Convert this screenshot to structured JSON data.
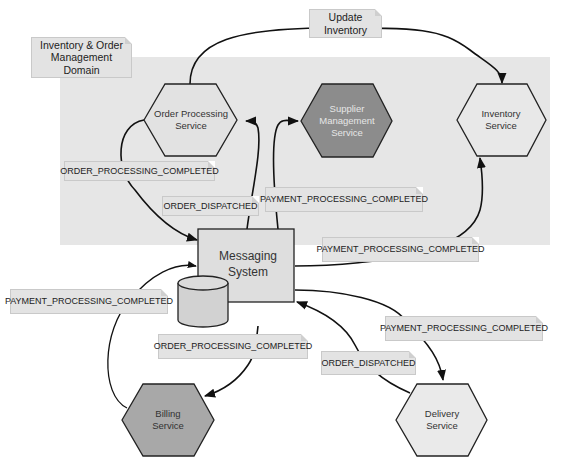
{
  "domain_label": "Inventory & Order Management Domain",
  "colors": {
    "domain_bg": "#e6e6e6",
    "note_bg": "#e3e3e3",
    "hex_light": "#e8e8e8",
    "hex_dark": "#8a8a8a",
    "hex_medium": "#a8a8a8",
    "stroke": "#222222"
  },
  "nodes": {
    "order_processing": {
      "label": "Order Processing Service"
    },
    "supplier_management": {
      "label": "Supplier Management Service"
    },
    "inventory": {
      "label": "Inventory Service"
    },
    "messaging": {
      "label": "Messaging System"
    },
    "billing": {
      "label": "Billing Service"
    },
    "delivery": {
      "label": "Delivery Service"
    }
  },
  "edge_labels": {
    "update_inventory": "Update Inventory",
    "order_processing_completed_1": "ORDER_PROCESSING_COMPLETED",
    "order_dispatched_1": "ORDER_DISPATCHED",
    "payment_processing_completed_1": "PAYMENT_PROCESSING_COMPLETED",
    "payment_processing_completed_2": "PAYMENT_PROCESSING_COMPLETED",
    "payment_processing_completed_3": "PAYMENT_PROCESSING_COMPLETED",
    "order_processing_completed_2": "ORDER_PROCESSING_COMPLETED",
    "payment_processing_completed_4": "PAYMENT_PROCESSING_COMPLETED",
    "order_dispatched_2": "ORDER_DISPATCHED"
  }
}
